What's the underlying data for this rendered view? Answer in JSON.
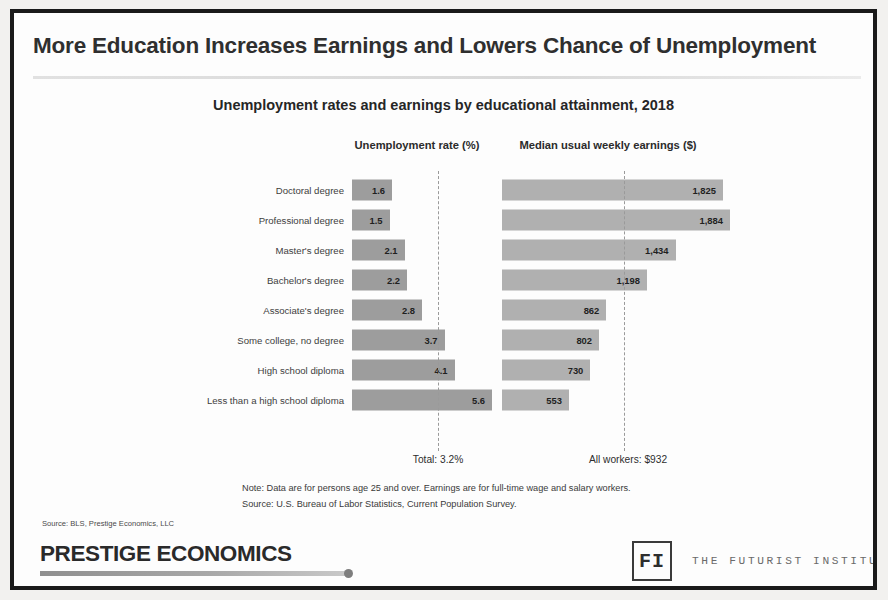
{
  "slide": {
    "title": "More Education Increases Earnings and Lowers Chance of Unemployment"
  },
  "headers": {
    "unemployment": "Unemployment rate (%)",
    "earnings": "Median usual weekly earnings ($)"
  },
  "reference": {
    "unemployment_label": "Total: 3.2%",
    "earnings_label": "All workers: $932"
  },
  "notes": {
    "note": "Note: Data are for persons age 25 and over. Earnings are for full-time wage and salary workers.",
    "source": "Source: U.S. Bureau of Labor Statistics, Current Population Survey.",
    "credit": "Source: BLS, Prestige Economics, LLC"
  },
  "footer": {
    "brand": "PRESTIGE ECONOMICS",
    "fi_logo": "FI",
    "fi_wordmark": "THE FUTURIST INSTITUTE"
  },
  "colors": {
    "bar_unemployment": "#9d9d9d",
    "bar_earnings": "#b0b0b0",
    "frame": "#1a1a1a",
    "title_text": "#2f2f2f"
  },
  "chart_data": {
    "type": "bar",
    "title": "Unemployment rates and earnings by educational attainment, 2018",
    "orientation": "horizontal",
    "panels": [
      {
        "name": "Unemployment rate (%)",
        "xlabel": "Unemployment rate (%)",
        "max": 5.6,
        "reference_value": 3.2,
        "reference_label": "Total: 3.2%",
        "values": [
          1.6,
          1.5,
          2.1,
          2.2,
          2.8,
          3.7,
          4.1,
          5.6
        ],
        "value_labels": [
          "1.6",
          "1.5",
          "2.1",
          "2.2",
          "2.8",
          "3.7",
          "4.1",
          "5.6"
        ]
      },
      {
        "name": "Median usual weekly earnings ($)",
        "xlabel": "Median usual weekly earnings ($)",
        "max": 1884,
        "reference_value": 932,
        "reference_label": "All workers: $932",
        "values": [
          1825,
          1884,
          1434,
          1198,
          862,
          802,
          730,
          553
        ],
        "value_labels": [
          "1,825",
          "1,884",
          "1,434",
          "1,198",
          "862",
          "802",
          "730",
          "553"
        ]
      }
    ],
    "categories": [
      "Doctoral degree",
      "Professional degree",
      "Master's degree",
      "Bachelor's degree",
      "Associate's degree",
      "Some college, no degree",
      "High school diploma",
      "Less than a high school diploma"
    ],
    "grid": false,
    "legend": "none"
  }
}
